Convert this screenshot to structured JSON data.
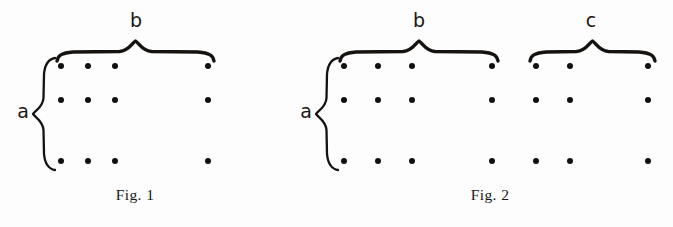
{
  "document": {
    "kind": "mathematical-lattice-diagram",
    "background_color": "#fdfdfd",
    "ink_color": "#15120f"
  },
  "figures": [
    {
      "id": "fig-1",
      "caption": "Fig. 1",
      "caption_x": 135,
      "caption_y": 200,
      "vertical_brace": {
        "label": "a",
        "label_x": 23,
        "label_y": 118,
        "top": 58,
        "bottom": 170,
        "x": 44
      },
      "horizontal_braces": [
        {
          "label": "b",
          "label_x": 136,
          "label_y": 27,
          "left": 57,
          "right": 214,
          "y": 52
        }
      ],
      "dot_rows_y": [
        66,
        100,
        161
      ],
      "dot_cols_x": [
        61,
        88,
        115,
        208
      ],
      "dot_radius": 3.0,
      "rows": 3,
      "columns": 4
    },
    {
      "id": "fig-2",
      "caption": "Fig. 2",
      "caption_x": 490,
      "caption_y": 200,
      "vertical_brace": {
        "label": "a",
        "label_x": 306,
        "label_y": 118,
        "top": 58,
        "bottom": 170,
        "x": 327
      },
      "horizontal_braces": [
        {
          "label": "b",
          "label_x": 419,
          "label_y": 27,
          "left": 340,
          "right": 498,
          "y": 52
        },
        {
          "label": "c",
          "label_x": 591,
          "label_y": 27,
          "left": 530,
          "right": 655,
          "y": 52
        }
      ],
      "dot_rows_y": [
        66,
        100,
        161
      ],
      "dot_cols_x": [
        344,
        378,
        412,
        492,
        536,
        570,
        648
      ],
      "dot_radius": 3.0,
      "rows": 3,
      "columns": 7
    }
  ],
  "labels": {
    "a": "a",
    "b": "b",
    "c": "c",
    "fig1": "Fig. 1",
    "fig2": "Fig. 2"
  },
  "chart_data": {
    "type": "scatter",
    "title": "",
    "panels": [
      {
        "name": "Fig. 1",
        "grid_rows": 3,
        "grid_columns": 4,
        "row_label": "a",
        "column_group_labels": [
          "b"
        ],
        "points_x": [
          61,
          88,
          115,
          208
        ],
        "points_y": [
          66,
          100,
          161
        ]
      },
      {
        "name": "Fig. 2",
        "grid_rows": 3,
        "grid_columns": 7,
        "row_label": "a",
        "column_group_labels": [
          "b",
          "c"
        ],
        "group_b_points_x": [
          344,
          378,
          412,
          492
        ],
        "group_c_points_x": [
          536,
          570,
          648
        ],
        "points_y": [
          66,
          100,
          161
        ]
      }
    ],
    "xlabel": "",
    "ylabel": "",
    "grid": false,
    "legend": "none"
  }
}
